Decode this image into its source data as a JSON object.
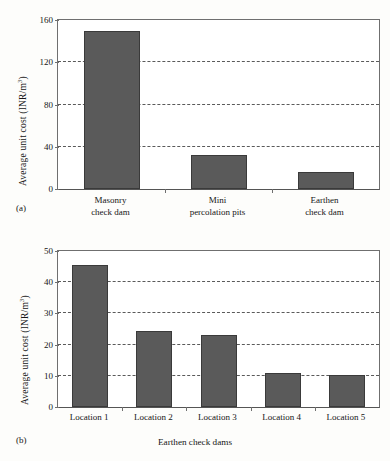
{
  "figure": {
    "panels": [
      {
        "tag": "(a)",
        "chart_data": {
          "type": "bar",
          "title": "",
          "xlabel": "",
          "ylabel": "Average unit cost (INR/m3)",
          "ylabel_prefix": "Average unit cost (INR/m",
          "ylabel_sup": "3",
          "ylabel_suffix": ")",
          "categories": [
            "Masonry check dam",
            "Mini percolation pits",
            "Earthen check dam"
          ],
          "category_lines": [
            [
              "Masonry",
              "check dam"
            ],
            [
              "Mini",
              "percolation pits"
            ],
            [
              "Earthen",
              "check dam"
            ]
          ],
          "values": [
            150,
            32,
            16
          ],
          "ylim": [
            0,
            160
          ],
          "yticks": [
            0,
            40,
            80,
            120,
            160
          ],
          "ytick_labels": [
            "0",
            "40",
            "80",
            "120",
            "160"
          ],
          "gridlines": [
            40,
            80,
            120
          ],
          "grid": true,
          "legend": "none",
          "bar_color": "#5a5a5a"
        }
      },
      {
        "tag": "(b)",
        "chart_data": {
          "type": "bar",
          "title": "",
          "xlabel": "Earthen check dams",
          "ylabel": "Average unit cost (INR/m3)",
          "ylabel_prefix": "Average unit cost (INR/m",
          "ylabel_sup": "3",
          "ylabel_suffix": ")",
          "categories": [
            "Location 1",
            "Location 2",
            "Location 3",
            "Location 4",
            "Location 5"
          ],
          "values": [
            45.5,
            24.5,
            23,
            11,
            10.3
          ],
          "ylim": [
            0,
            50
          ],
          "yticks": [
            0,
            10,
            20,
            30,
            40,
            50
          ],
          "ytick_labels": [
            "0",
            "10",
            "20",
            "30",
            "40",
            "50"
          ],
          "gridlines": [
            10,
            20,
            30,
            40
          ],
          "grid": true,
          "legend": "none",
          "bar_color": "#5a5a5a"
        }
      }
    ]
  }
}
